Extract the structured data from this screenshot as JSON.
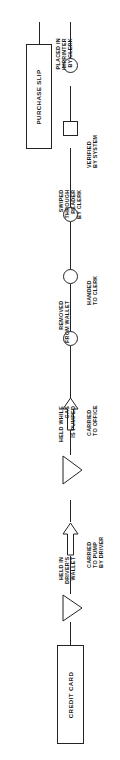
{
  "chart_title": "",
  "orientation": "rotated-90-ccw",
  "accent_color": "#232323",
  "background_color": "#ffffff",
  "entities": {
    "start": {
      "label": "CREDIT CARD"
    },
    "end": {
      "label": "PURCHASE SLIP"
    }
  },
  "symbol_legend": {
    "operation": "circle",
    "inspection": "square",
    "delay": "triangle",
    "transport": "arrow"
  },
  "steps": [
    {
      "index": 1,
      "label": "HELD IN\nDRIVER'S\nWALLET",
      "symbol": "delay"
    },
    {
      "index": 2,
      "label": "CARRIED\nTO PUMP\nBY DRIVER",
      "symbol": "transport"
    },
    {
      "index": 3,
      "label": "HELD WHILE\nGAS\nIS PUMPED",
      "symbol": "delay"
    },
    {
      "index": 4,
      "label": "CARRIED\nTO OFFICE",
      "symbol": "transport"
    },
    {
      "index": 5,
      "label": "REMOVED\nFROM WALLET",
      "symbol": "operation"
    },
    {
      "index": 6,
      "label": "HANDED\nTO CLERK",
      "symbol": "operation"
    },
    {
      "index": 7,
      "label": "SWIPED\nTHROUGH\nREADER\nBY CLERK",
      "symbol": "operation"
    },
    {
      "index": 8,
      "label": "VERIFIED\nBY SYSTEM",
      "symbol": "inspection"
    },
    {
      "index": 9,
      "label": "PLACED IN\nIMPRINTER\nBY CLERK",
      "symbol": "operation"
    }
  ]
}
